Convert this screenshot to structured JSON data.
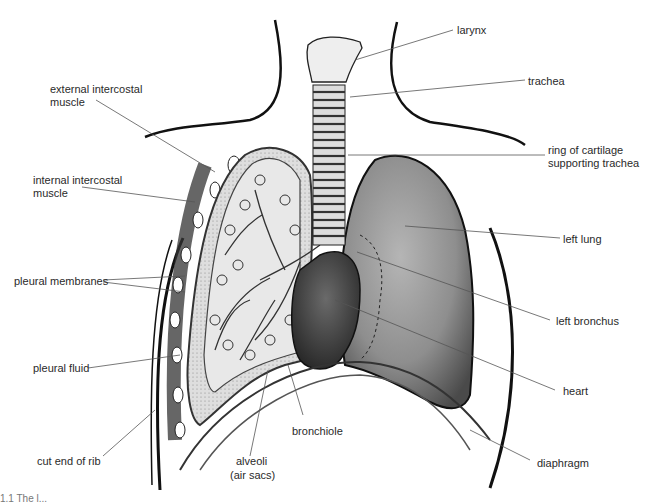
{
  "diagram": {
    "caption_fragment": "1.1 The l...",
    "labels": {
      "larynx": "larynx",
      "trachea": "trachea",
      "ring_of_cartilage_line1": "ring of cartilage",
      "ring_of_cartilage_line2": "supporting trachea",
      "left_lung": "left lung",
      "left_bronchus": "left bronchus",
      "heart": "heart",
      "diaphragm": "diaphragm",
      "external_intercostal_line1": "external intercostal",
      "external_intercostal_line2": "muscle",
      "internal_intercostal_line1": "internal intercostal",
      "internal_intercostal_line2": "muscle",
      "pleural_membranes": "pleural membranes",
      "pleural_fluid": "pleural fluid",
      "cut_end_of_rib": "cut end of rib",
      "alveoli_line1": "alveoli",
      "alveoli_line2": "(air sacs)",
      "bronchiole": "bronchiole"
    },
    "colors": {
      "outline": "#111111",
      "left_lung_fill": "#8a8a8a",
      "heart_fill": "#3c3c3c",
      "right_lung_fill": "#e2e2e2",
      "leader_line": "#555555"
    }
  }
}
